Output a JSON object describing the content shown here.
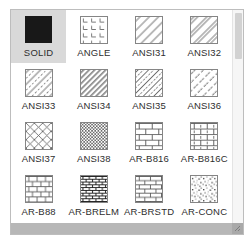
{
  "palette": {
    "items": [
      {
        "label": "SOLID",
        "pattern": "solid",
        "selected": true
      },
      {
        "label": "ANGLE",
        "pattern": "angle",
        "selected": false
      },
      {
        "label": "ANSI31",
        "pattern": "ansi31",
        "selected": false
      },
      {
        "label": "ANSI32",
        "pattern": "ansi32",
        "selected": false
      },
      {
        "label": "ANSI33",
        "pattern": "ansi33",
        "selected": false
      },
      {
        "label": "ANSI34",
        "pattern": "ansi34",
        "selected": false
      },
      {
        "label": "ANSI35",
        "pattern": "ansi35",
        "selected": false
      },
      {
        "label": "ANSI36",
        "pattern": "ansi36",
        "selected": false
      },
      {
        "label": "ANSI37",
        "pattern": "ansi37",
        "selected": false
      },
      {
        "label": "ANSI38",
        "pattern": "ansi38",
        "selected": false
      },
      {
        "label": "AR-B816",
        "pattern": "ar-b816",
        "selected": false
      },
      {
        "label": "AR-B816C",
        "pattern": "ar-b816c",
        "selected": false
      },
      {
        "label": "AR-B88",
        "pattern": "ar-b88",
        "selected": false
      },
      {
        "label": "AR-BRELM",
        "pattern": "ar-brelm",
        "selected": false
      },
      {
        "label": "AR-BRSTD",
        "pattern": "ar-brstd",
        "selected": false
      },
      {
        "label": "AR-CONC",
        "pattern": "ar-conc",
        "selected": false
      }
    ]
  },
  "colors": {
    "selected_bg": "#d9d9d9",
    "solid_swatch": "#181818",
    "panel_border": "#bdbdbd",
    "hatch_stroke": "#5f5f5f",
    "scrollbar_thumb": "#b7b7b7"
  }
}
